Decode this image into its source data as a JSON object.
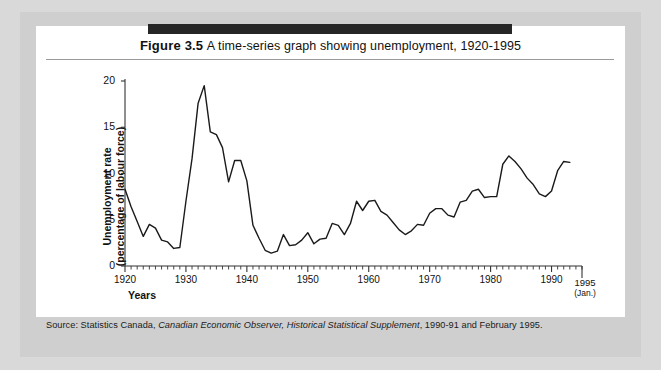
{
  "figure": {
    "number": "Figure 3.5",
    "title": "A time-series graph showing unemployment, 1920-1995",
    "source": "Source: Statistics Canada, ",
    "source_italic_1": "Canadian Economic Observer, Historical Statistical Supplement",
    "source_tail": ", 1990-91 and February 1995."
  },
  "labels": {
    "years_axis": "Years",
    "end_year": "1995",
    "end_year_note": "(Jan.)",
    "y_axis_line1": "Unemployment rate",
    "y_axis_line2": "(percentage of labour force)"
  },
  "colors": {
    "line": "#1a1a1a",
    "axis": "#333333",
    "panel": "#ffffff",
    "frame": "#cfcfcf",
    "page": "#d9d9d9",
    "bar": "#262626",
    "rule": "#9a9a9a"
  },
  "chart_data": {
    "type": "line",
    "title": "A time-series graph showing unemployment, 1920-1995",
    "xlabel": "Years",
    "ylabel": "Unemployment rate (percentage of labour force)",
    "xlim": [
      1920,
      1995
    ],
    "ylim": [
      0,
      20
    ],
    "yticks": [
      0,
      5,
      10,
      15,
      20
    ],
    "xticks": [
      1920,
      1930,
      1940,
      1950,
      1960,
      1970,
      1980,
      1990
    ],
    "xtick_labels": [
      "1920",
      "1930",
      "1940",
      "1950",
      "1960",
      "1970",
      "1980",
      "1990"
    ],
    "minor_xtick_interval": 1,
    "grid": false,
    "legend": null,
    "series_name": "Unemployment rate",
    "x": [
      1920,
      1921,
      1922,
      1923,
      1924,
      1925,
      1926,
      1927,
      1928,
      1929,
      1930,
      1931,
      1932,
      1933,
      1934,
      1935,
      1936,
      1937,
      1938,
      1939,
      1940,
      1941,
      1942,
      1943,
      1944,
      1945,
      1946,
      1947,
      1948,
      1949,
      1950,
      1951,
      1952,
      1953,
      1954,
      1955,
      1956,
      1957,
      1958,
      1959,
      1960,
      1961,
      1962,
      1963,
      1964,
      1965,
      1966,
      1967,
      1968,
      1969,
      1970,
      1971,
      1972,
      1973,
      1974,
      1975,
      1976,
      1977,
      1978,
      1979,
      1980,
      1981,
      1982,
      1983,
      1984,
      1985,
      1986,
      1987,
      1988,
      1989,
      1990,
      1991,
      1992,
      1993
    ],
    "y": [
      8.3,
      6.4,
      4.8,
      3.2,
      4.5,
      4.1,
      2.8,
      2.6,
      1.9,
      2.0,
      7.0,
      11.6,
      17.6,
      19.5,
      14.5,
      14.2,
      12.8,
      9.1,
      11.4,
      11.4,
      9.2,
      4.4,
      3.0,
      1.7,
      1.4,
      1.6,
      3.4,
      2.2,
      2.3,
      2.8,
      3.6,
      2.4,
      2.9,
      3.0,
      4.6,
      4.4,
      3.4,
      4.6,
      7.0,
      6.0,
      7.0,
      7.1,
      5.9,
      5.5,
      4.7,
      3.9,
      3.4,
      3.8,
      4.5,
      4.4,
      5.7,
      6.2,
      6.2,
      5.5,
      5.3,
      6.9,
      7.1,
      8.1,
      8.3,
      7.4,
      7.5,
      7.5,
      11.0,
      11.9,
      11.3,
      10.5,
      9.5,
      8.8,
      7.8,
      7.5,
      8.1,
      10.3,
      11.3,
      11.2
    ],
    "annotations": [
      {
        "text": "1995 (Jan.)",
        "x": 1995,
        "note": "right end-of-axis label"
      }
    ],
    "notable_points": [
      {
        "year": 1933,
        "value": 19.5,
        "note": "Great Depression peak"
      },
      {
        "year": 1944,
        "value": 1.4,
        "note": "wartime low"
      },
      {
        "year": 1983,
        "value": 11.9,
        "note": "early-1980s recession peak"
      },
      {
        "year": 1992,
        "value": 11.3,
        "note": "early-1990s recession peak"
      }
    ]
  }
}
